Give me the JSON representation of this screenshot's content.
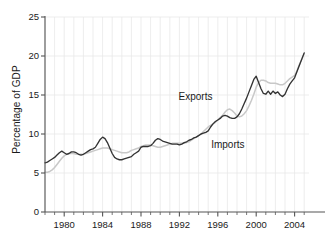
{
  "chart_data": {
    "type": "line",
    "title": "",
    "xlabel": "",
    "ylabel": "Percentage of GDP",
    "xlim": [
      1978,
      2005.5
    ],
    "ylim": [
      0,
      25
    ],
    "yticks": [
      0,
      5,
      10,
      15,
      20,
      25
    ],
    "ytick_labels": [
      "0",
      "5",
      "10",
      "15",
      "20",
      "25"
    ],
    "xticks": [
      1980,
      1984,
      1988,
      1992,
      1996,
      2000,
      2004
    ],
    "xtick_labels": [
      "1980",
      "1984",
      "1988",
      "1992",
      "1996",
      "2000",
      "2004"
    ],
    "xminor_step": 1,
    "grid": true,
    "grid_color": "#e8e8e8",
    "legend_position": "inline-annotation",
    "annotations": [
      {
        "text": "Exports",
        "x": 1994.2,
        "y": 14.6
      },
      {
        "text": "Imports",
        "x": 1997.6,
        "y": 8.4
      }
    ],
    "series": [
      {
        "name": "Exports",
        "color": "#c8c8c8",
        "x": [
          1978.0,
          1978.25,
          1978.5,
          1978.75,
          1979.0,
          1979.25,
          1979.5,
          1979.75,
          1980.0,
          1980.25,
          1980.5,
          1980.75,
          1981.0,
          1981.25,
          1981.5,
          1981.75,
          1982.0,
          1982.25,
          1982.5,
          1982.75,
          1983.0,
          1983.25,
          1983.5,
          1983.75,
          1984.0,
          1984.25,
          1984.5,
          1984.75,
          1985.0,
          1985.25,
          1985.5,
          1985.75,
          1986.0,
          1986.25,
          1986.5,
          1986.75,
          1987.0,
          1987.25,
          1987.5,
          1987.75,
          1988.0,
          1988.25,
          1988.5,
          1988.75,
          1989.0,
          1989.25,
          1989.5,
          1989.75,
          1990.0,
          1990.25,
          1990.5,
          1990.75,
          1991.0,
          1991.25,
          1991.5,
          1991.75,
          1992.0,
          1992.25,
          1992.5,
          1992.75,
          1993.0,
          1993.25,
          1993.5,
          1993.75,
          1994.0,
          1994.25,
          1994.5,
          1994.75,
          1995.0,
          1995.25,
          1995.5,
          1995.75,
          1996.0,
          1996.25,
          1996.5,
          1996.75,
          1997.0,
          1997.25,
          1997.5,
          1997.75,
          1998.0,
          1998.25,
          1998.5,
          1998.75,
          1999.0,
          1999.25,
          1999.5,
          1999.75,
          2000.0,
          2000.25,
          2000.5,
          2000.75,
          2001.0,
          2001.25,
          2001.5,
          2001.75,
          2002.0,
          2002.25,
          2002.5,
          2002.75,
          2003.0,
          2003.25,
          2003.5,
          2003.75,
          2004.0,
          2004.25,
          2004.5,
          2004.75,
          2005.0
        ],
        "y": [
          5.1,
          5.1,
          5.2,
          5.4,
          5.7,
          6.1,
          6.5,
          6.9,
          7.2,
          7.4,
          7.5,
          7.5,
          7.5,
          7.4,
          7.4,
          7.4,
          7.4,
          7.5,
          7.6,
          7.7,
          7.8,
          7.9,
          8.0,
          8.1,
          8.2,
          8.2,
          8.2,
          8.1,
          8.0,
          7.9,
          7.8,
          7.7,
          7.6,
          7.6,
          7.6,
          7.7,
          7.9,
          8.0,
          8.1,
          8.2,
          8.4,
          8.5,
          8.6,
          8.6,
          8.6,
          8.5,
          8.4,
          8.3,
          8.3,
          8.4,
          8.5,
          8.6,
          8.7,
          8.8,
          8.8,
          8.8,
          8.8,
          8.8,
          8.8,
          8.9,
          9.0,
          9.2,
          9.4,
          9.6,
          9.8,
          10.0,
          10.3,
          10.6,
          10.9,
          11.1,
          11.3,
          11.5,
          11.8,
          12.1,
          12.4,
          12.8,
          13.1,
          13.2,
          13.0,
          12.7,
          12.3,
          12.2,
          12.3,
          12.6,
          13.0,
          13.6,
          14.3,
          15.1,
          16.0,
          16.6,
          16.9,
          16.9,
          16.8,
          16.6,
          16.5,
          16.5,
          16.5,
          16.4,
          16.3,
          16.3,
          16.5,
          16.8,
          17.1,
          17.3,
          17.5,
          18.1,
          18.9,
          19.6,
          20.3
        ]
      },
      {
        "name": "Imports",
        "color": "#333333",
        "x": [
          1978.0,
          1978.25,
          1978.5,
          1978.75,
          1979.0,
          1979.25,
          1979.5,
          1979.75,
          1980.0,
          1980.25,
          1980.5,
          1980.75,
          1981.0,
          1981.25,
          1981.5,
          1981.75,
          1982.0,
          1982.25,
          1982.5,
          1982.75,
          1983.0,
          1983.25,
          1983.5,
          1983.75,
          1984.0,
          1984.25,
          1984.5,
          1984.75,
          1985.0,
          1985.25,
          1985.5,
          1985.75,
          1986.0,
          1986.25,
          1986.5,
          1986.75,
          1987.0,
          1987.25,
          1987.5,
          1987.75,
          1988.0,
          1988.25,
          1988.5,
          1988.75,
          1989.0,
          1989.25,
          1989.5,
          1989.75,
          1990.0,
          1990.25,
          1990.5,
          1990.75,
          1991.0,
          1991.25,
          1991.5,
          1991.75,
          1992.0,
          1992.25,
          1992.5,
          1992.75,
          1993.0,
          1993.25,
          1993.5,
          1993.75,
          1994.0,
          1994.25,
          1994.5,
          1994.75,
          1995.0,
          1995.25,
          1995.5,
          1995.75,
          1996.0,
          1996.25,
          1996.5,
          1996.75,
          1997.0,
          1997.25,
          1997.5,
          1997.75,
          1998.0,
          1998.25,
          1998.5,
          1998.75,
          1999.0,
          1999.25,
          1999.5,
          1999.75,
          2000.0,
          2000.25,
          2000.5,
          2000.75,
          2001.0,
          2001.25,
          2001.5,
          2001.75,
          2002.0,
          2002.25,
          2002.5,
          2002.75,
          2003.0,
          2003.25,
          2003.5,
          2003.75,
          2004.0,
          2004.25,
          2004.5,
          2004.75,
          2005.0
        ],
        "y": [
          6.3,
          6.4,
          6.6,
          6.8,
          7.0,
          7.3,
          7.6,
          7.8,
          7.6,
          7.4,
          7.5,
          7.7,
          7.7,
          7.6,
          7.4,
          7.3,
          7.4,
          7.6,
          7.8,
          8.0,
          8.1,
          8.3,
          8.8,
          9.3,
          9.6,
          9.4,
          8.9,
          8.2,
          7.5,
          7.0,
          6.8,
          6.7,
          6.7,
          6.8,
          6.9,
          7.0,
          7.1,
          7.4,
          7.6,
          7.8,
          8.3,
          8.4,
          8.4,
          8.4,
          8.5,
          8.8,
          9.2,
          9.4,
          9.3,
          9.1,
          9.0,
          8.9,
          8.8,
          8.7,
          8.7,
          8.7,
          8.6,
          8.7,
          8.9,
          9.0,
          9.2,
          9.3,
          9.5,
          9.6,
          9.8,
          10.0,
          10.1,
          10.2,
          10.4,
          10.9,
          11.3,
          11.6,
          11.8,
          12.0,
          12.3,
          12.4,
          12.3,
          12.1,
          12.0,
          12.0,
          12.2,
          12.6,
          13.2,
          13.9,
          14.6,
          15.4,
          16.2,
          17.0,
          17.4,
          16.6,
          15.8,
          15.2,
          15.1,
          15.5,
          15.1,
          15.5,
          15.2,
          15.4,
          15.0,
          14.8,
          15.1,
          15.8,
          16.4,
          16.8,
          17.2,
          18.0,
          18.8,
          19.6,
          20.4
        ]
      }
    ]
  },
  "axes": {
    "ylabel": "Percentage of GDP"
  }
}
